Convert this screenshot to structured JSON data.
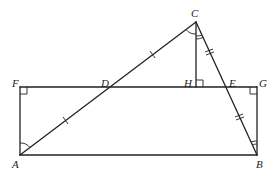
{
  "diagram": {
    "type": "geometry",
    "stroke_color": "#222222",
    "background": "#ffffff",
    "points": {
      "A": {
        "label": "A",
        "x": 20,
        "y": 155
      },
      "B": {
        "label": "B",
        "x": 257,
        "y": 155
      },
      "C": {
        "label": "C",
        "x": 196,
        "y": 22
      },
      "D": {
        "label": "D",
        "x": 108,
        "y": 87
      },
      "E": {
        "label": "E",
        "x": 226,
        "y": 87
      },
      "F": {
        "label": "F",
        "x": 20,
        "y": 87
      },
      "G": {
        "label": "G",
        "x": 257,
        "y": 87
      },
      "H": {
        "label": "H",
        "x": 196,
        "y": 87
      }
    },
    "segments": [
      "AB",
      "BG",
      "GF",
      "FA",
      "AC",
      "CB",
      "CH"
    ],
    "right_angles": [
      "F",
      "G",
      "H"
    ],
    "equal_marks": {
      "single_tick": [
        "AD",
        "DC"
      ],
      "double_tick": [
        "CE",
        "EB"
      ]
    },
    "angle_marks": {
      "single_arc": [
        "angle FAD",
        "angle ACH"
      ],
      "double_arc": [
        "angle HCE",
        "angle GBE"
      ]
    }
  }
}
